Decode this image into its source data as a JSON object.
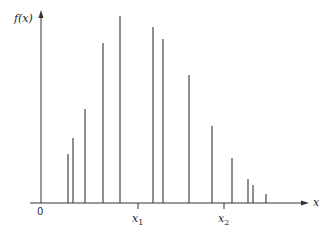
{
  "chart_data": {
    "type": "bar",
    "style": "vertical line spikes (probability mass function)",
    "title": "",
    "xlabel": "x",
    "ylabel": "f(x)",
    "x_tick_labels": [
      "0",
      "x1",
      "x2"
    ],
    "x_tick_positions_px": {
      "0": 41,
      "x1": 138,
      "x2": 224
    },
    "grid": false,
    "legend": null,
    "ylim": [
      0,
      190
    ],
    "x_px": [
      68,
      73,
      85,
      103,
      120,
      153,
      163,
      189,
      212,
      232,
      248,
      253,
      266
    ],
    "values": [
      49,
      65,
      94,
      160,
      187,
      176,
      164,
      128,
      77,
      45,
      24,
      18,
      9
    ],
    "value_units": "relative height (px above baseline, unlabeled axis)"
  },
  "labels": {
    "ylabel": "f(x)",
    "xlabel": "x",
    "origin": "0",
    "x1": "x",
    "x1_sub": "1",
    "x2": "x",
    "x2_sub": "2"
  },
  "colors": {
    "axis": "#333333",
    "bars": "#444444",
    "background": "#ffffff"
  }
}
